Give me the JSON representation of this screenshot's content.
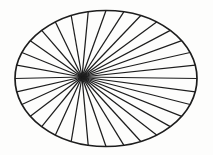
{
  "figure": {
    "name": "radiating-spoke-ellipse",
    "canvas": {
      "width": 213,
      "height": 155,
      "background_color": "#fdfdfc"
    },
    "ellipse": {
      "center_x": 106,
      "center_y": 78.5,
      "radius_x": 91,
      "radius_y": 68,
      "stroke_color": "#1d1d1d",
      "stroke_width": 1.7,
      "fill_color": "none"
    },
    "hub": {
      "label": "spoke convergence point",
      "x": 82,
      "y": 77,
      "offset_from_center_x": -24,
      "offset_from_center_y": -1.5
    },
    "spokes": {
      "count": 32,
      "stroke_color": "#1d1d1d",
      "stroke_width": 1.25,
      "start_angle_deg": 0,
      "angle_step_deg": 11.25,
      "description": "lines from hub to evenly spaced points on the ellipse rim"
    }
  },
  "chart_data": {
    "type": "scatter",
    "xlabel": "",
    "ylabel": "",
    "xlim": [
      15,
      197
    ],
    "ylim": [
      11,
      147
    ],
    "grid": false,
    "legend": "none",
    "annotations": [
      "Outer boundary is a single ellipse outline",
      "All chords converge at a single off-center hub left of the ellipse center",
      "Spoke endpoints are evenly distributed in parametric angle around the rim"
    ],
    "series": [
      {
        "name": "rim-endpoints",
        "angles_deg": [
          0,
          11.25,
          22.5,
          33.75,
          45,
          56.25,
          67.5,
          78.75,
          90,
          101.25,
          112.5,
          123.75,
          135,
          146.25,
          157.5,
          168.75,
          180,
          191.25,
          202.5,
          213.75,
          225,
          236.25,
          247.5,
          258.75,
          270,
          281.25,
          292.5,
          303.75,
          315,
          326.25,
          337.5,
          348.75
        ],
        "x": [
          197,
          195.3,
          190.1,
          181.7,
          170.3,
          156.6,
          140.8,
          123.8,
          106,
          88.2,
          71.2,
          55.4,
          41.7,
          30.3,
          21.9,
          16.7,
          15,
          16.7,
          21.9,
          30.3,
          41.7,
          55.4,
          71.2,
          88.2,
          106,
          123.8,
          140.8,
          156.6,
          170.3,
          181.7,
          190.1,
          195.3
        ],
        "y": [
          78.5,
          65.2,
          52.5,
          40.7,
          30.4,
          22.0,
          15.5,
          11.8,
          10.5,
          11.8,
          15.5,
          22.0,
          30.4,
          40.7,
          52.5,
          65.2,
          78.5,
          91.8,
          104.5,
          116.3,
          126.6,
          135.0,
          141.5,
          145.2,
          146.5,
          145.2,
          141.5,
          135.0,
          126.6,
          116.3,
          104.5,
          91.8
        ]
      },
      {
        "name": "hub",
        "x": [
          82
        ],
        "y": [
          77
        ]
      }
    ]
  }
}
